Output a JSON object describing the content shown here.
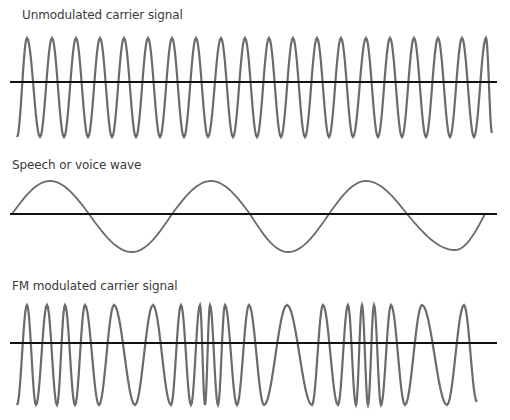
{
  "panels": [
    {
      "title": "Unmodulated carrier signal"
    },
    {
      "title": "Speech or voice wave"
    },
    {
      "title": "FM modulated carrier signal"
    }
  ],
  "colors": {
    "wave": "#6b6b6b",
    "axis": "#111111",
    "text": "#3a3a3a"
  },
  "chart_data": [
    {
      "type": "line",
      "title": "Unmodulated carrier signal",
      "description": "Constant-frequency sine wave",
      "baseline_y": 82,
      "peak_y": 38,
      "trough_y": 137,
      "x_start": 17,
      "x_end": 492,
      "axis_x": [
        10,
        497
      ],
      "peaks_x": [
        27,
        52,
        76,
        100,
        124,
        148,
        172,
        196,
        221,
        245,
        269,
        293,
        317,
        341,
        366,
        390,
        414,
        438,
        462,
        486
      ],
      "troughs_x": [
        17,
        40,
        64,
        88,
        112,
        136,
        160,
        184,
        208,
        233,
        257,
        281,
        305,
        329,
        353,
        378,
        402,
        426,
        450,
        474
      ],
      "cycles": 20
    },
    {
      "type": "line",
      "title": "Speech or voice wave",
      "description": "Low-frequency sine wave (~3 cycles)",
      "baseline_y": 214,
      "peak_y": 181,
      "trough_y": 252,
      "x_start": 12,
      "x_end": 485,
      "axis_x": [
        10,
        497
      ],
      "points": [
        [
          12,
          214
        ],
        [
          50,
          181
        ],
        [
          89,
          214
        ],
        [
          132,
          252
        ],
        [
          172,
          214
        ],
        [
          211,
          181
        ],
        [
          250,
          214
        ],
        [
          288,
          252
        ],
        [
          329,
          214
        ],
        [
          366,
          181
        ],
        [
          407,
          214
        ],
        [
          455,
          250
        ],
        [
          485,
          214
        ]
      ]
    },
    {
      "type": "line",
      "title": "FM modulated carrier signal",
      "description": "Carrier whose frequency varies with the voice wave amplitude",
      "baseline_y": 343,
      "peak_y": 305,
      "trough_y": 405,
      "x_start": 17,
      "x_end": 477,
      "axis_x": [
        10,
        497
      ],
      "extrema_x": [
        17,
        27,
        36,
        47,
        57,
        65,
        75,
        85,
        99,
        114,
        135,
        153,
        171,
        181,
        191,
        200,
        205,
        210,
        218,
        225,
        237,
        249,
        264,
        287,
        312,
        323,
        338,
        348,
        356,
        362,
        368,
        374,
        381,
        391,
        405,
        422,
        447,
        464,
        477
      ]
    }
  ]
}
